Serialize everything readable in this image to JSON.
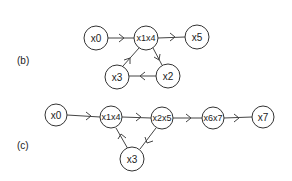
{
  "diagrams": {
    "b": {
      "label": "(b)",
      "nodes": [
        {
          "id": "x0",
          "label": "x0"
        },
        {
          "id": "x1x4",
          "label": "x1x4"
        },
        {
          "id": "x5",
          "label": "x5"
        },
        {
          "id": "x3",
          "label": "x3"
        },
        {
          "id": "x2",
          "label": "x2"
        }
      ],
      "edges": [
        {
          "from": "x0",
          "to": "x1x4"
        },
        {
          "from": "x1x4",
          "to": "x5"
        },
        {
          "from": "x1x4",
          "to": "x2"
        },
        {
          "from": "x2",
          "to": "x3"
        },
        {
          "from": "x3",
          "to": "x1x4"
        }
      ]
    },
    "c": {
      "label": "(c)",
      "nodes": [
        {
          "id": "x0",
          "label": "x0"
        },
        {
          "id": "x1x4",
          "label": "x1x4"
        },
        {
          "id": "x2x5",
          "label": "x2x5"
        },
        {
          "id": "x6x7",
          "label": "x6x7"
        },
        {
          "id": "x7",
          "label": "x7"
        },
        {
          "id": "x3",
          "label": "x3"
        }
      ],
      "edges": [
        {
          "from": "x0",
          "to": "x1x4"
        },
        {
          "from": "x1x4",
          "to": "x2x5"
        },
        {
          "from": "x2x5",
          "to": "x6x7"
        },
        {
          "from": "x6x7",
          "to": "x7"
        },
        {
          "from": "x2x5",
          "to": "x3"
        },
        {
          "from": "x3",
          "to": "x1x4"
        }
      ]
    }
  }
}
